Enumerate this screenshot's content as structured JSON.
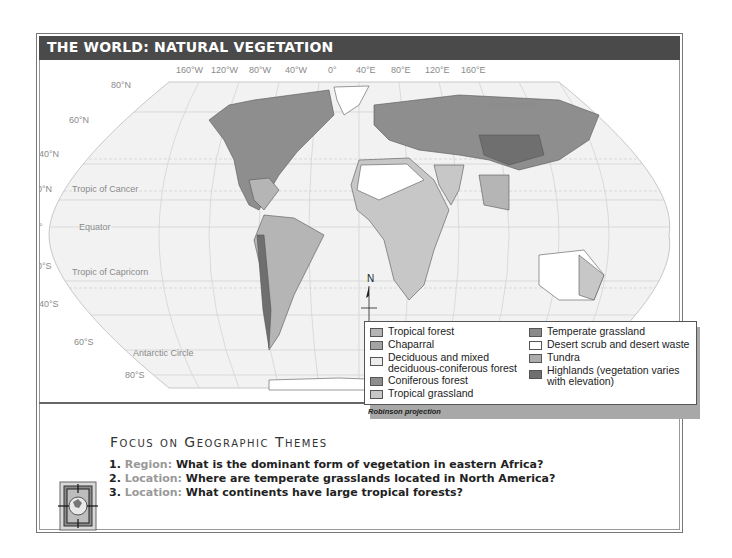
{
  "title": "THE WORLD:  NATURAL VEGETATION",
  "map": {
    "projection": "Robinson projection",
    "longitude_labels": [
      "160°W",
      "120°W",
      "80°W",
      "40°W",
      "0°",
      "40°E",
      "80°E",
      "120°E",
      "160°E"
    ],
    "latitude_labels": [
      "80°N",
      "60°N",
      "40°N",
      "20°N",
      "0°",
      "20°S",
      "40°S",
      "60°S",
      "80°S"
    ],
    "reference_lines": {
      "arctic_circle": "Arctic Circle",
      "tropic_of_cancer": "Tropic of Cancer",
      "equator": "Equator",
      "tropic_of_capricorn": "Tropic of Capricorn",
      "antarctic_circle": "Antarctic Circle"
    },
    "compass": "N"
  },
  "legend": {
    "left": [
      {
        "label": "Tropical forest",
        "color": "#b5b5b5"
      },
      {
        "label": "Chaparral",
        "color": "#a3a3a3"
      },
      {
        "label": "Deciduous and mixed deciduous-coniferous forest",
        "color": "#ececec"
      },
      {
        "label": "Coniferous forest",
        "color": "#8e8e8e"
      },
      {
        "label": "Tropical grassland",
        "color": "#c7c7c7"
      }
    ],
    "right": [
      {
        "label": "Temperate grassland",
        "color": "#8a8a8a"
      },
      {
        "label": "Desert scrub and desert waste",
        "color": "#ffffff"
      },
      {
        "label": "Tundra",
        "color": "#acacac"
      },
      {
        "label": "Highlands (vegetation varies with elevation)",
        "color": "#6f6f6f"
      }
    ]
  },
  "focus": {
    "heading": "Focus on Geographic Themes",
    "questions": [
      {
        "num": "1.",
        "theme": "Region:",
        "text": "What is the dominant form of vegetation in eastern Africa?"
      },
      {
        "num": "2.",
        "theme": "Location:",
        "text": "Where are temperate grasslands located in North America?"
      },
      {
        "num": "3.",
        "theme": "Location:",
        "text": "What continents have large tropical forests?"
      }
    ]
  }
}
